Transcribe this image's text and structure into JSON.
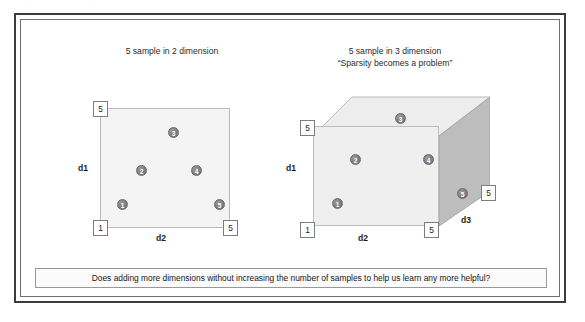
{
  "slide": {
    "panel_2d": {
      "title": "5 sample in 2 dimension",
      "axis_y_label": "d1",
      "axis_x_label": "d2",
      "tag_top_left": "5",
      "tag_bottom_left": "1",
      "tag_bottom_right": "5",
      "samples": [
        {
          "label": "1",
          "x": 22,
          "y": 96
        },
        {
          "label": "2",
          "x": 41,
          "y": 62
        },
        {
          "label": "3",
          "x": 73,
          "y": 24
        },
        {
          "label": "4",
          "x": 96,
          "y": 62
        },
        {
          "label": "5",
          "x": 119,
          "y": 96
        }
      ]
    },
    "panel_3d": {
      "title_line1": "5 sample in 3 dimension",
      "title_line2": "“Sparsity becomes a problem”",
      "axis_y_label": "d1",
      "axis_x_label": "d2",
      "axis_z_label": "d3",
      "tag_top_left": "5",
      "tag_bottom_left": "1",
      "tag_bottom_right": "5",
      "tag_depth": "5",
      "samples_front": [
        {
          "label": "1",
          "x": 25,
          "y": 78
        },
        {
          "label": "2",
          "x": 43,
          "y": 40
        },
        {
          "label": "4",
          "x": 101,
          "y": 40
        }
      ],
      "samples_top": [
        {
          "label": "3",
          "x": 99,
          "y": 15
        }
      ],
      "samples_right": [
        {
          "label": "5",
          "x": 38,
          "y": 82
        }
      ]
    },
    "caption": "Does adding more dimensions without increasing the number of samples to help us learn any more helpful?",
    "colors": {
      "frame_outer": "#3c3c3c",
      "frame_inner": "#6f6f6f",
      "square_fill": "#f4f4f4",
      "cube_front_fill": "#efefef",
      "cube_top_fill": "#ededed",
      "cube_right_fill": "#bdbdbd",
      "dot_fill": "#7e7e7e",
      "text": "#1d1d1d"
    },
    "scan_artifact_left": "..",
    "scan_artifact_right": ".."
  }
}
